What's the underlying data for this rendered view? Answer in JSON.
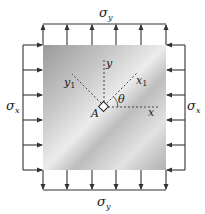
{
  "diagram": {
    "labels": {
      "sigma_y_top": "σ",
      "sigma_y_top_sub": "y",
      "sigma_y_bottom": "σ",
      "sigma_y_bottom_sub": "y",
      "sigma_x_left": "σ",
      "sigma_x_left_sub": "x",
      "sigma_x_right": "σ",
      "sigma_x_right_sub": "x",
      "axis_x": "x",
      "axis_y": "y",
      "axis_x1": "x",
      "axis_x1_sub": "1",
      "axis_y1": "y",
      "axis_y1_sub": "1",
      "angle": "θ",
      "point": "A"
    },
    "colors": {
      "arrow": "#333333",
      "axis_dashed": "#444444",
      "plate_light": "#f2f2f2",
      "plate_dark": "#a8a8a8"
    },
    "arrows_per_side": 6
  }
}
